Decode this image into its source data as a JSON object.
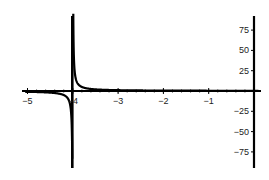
{
  "chart_data": {
    "type": "line",
    "title": "",
    "xlabel": "",
    "ylabel": "",
    "function": "y = 1/(x+4)",
    "xlim": [
      -5.1,
      0.1
    ],
    "ylim": [
      -90,
      90
    ],
    "vertical_asymptote": -4,
    "grid": false,
    "legend": null,
    "x_ticks": [
      -5,
      -4,
      -3,
      -2,
      -1
    ],
    "x_tick_labels": [
      "-5",
      "-4",
      "-3",
      "-2",
      "-1"
    ],
    "y_ticks": [
      75,
      50,
      25,
      -25,
      -50,
      -75
    ],
    "y_tick_labels": [
      "75",
      "50",
      "25",
      "-25",
      "-50",
      "-75"
    ],
    "series": [
      {
        "name": "f(x)",
        "color": "#000000",
        "x": [
          -5,
          -4.8,
          -4.6,
          -4.4,
          -4.2,
          -4.1,
          -4.05,
          -4.02,
          -4.012,
          -3.988,
          -3.98,
          -3.95,
          -3.9,
          -3.8,
          -3.6,
          -3.4,
          -3.0,
          -2.0,
          -1.0,
          0
        ],
        "values": [
          -1,
          -1.25,
          -1.67,
          -2.5,
          -5,
          -10,
          -20,
          -50,
          -83,
          83,
          50,
          20,
          10,
          5,
          2.5,
          1.67,
          1,
          0.5,
          0.33,
          0.25
        ]
      }
    ]
  }
}
